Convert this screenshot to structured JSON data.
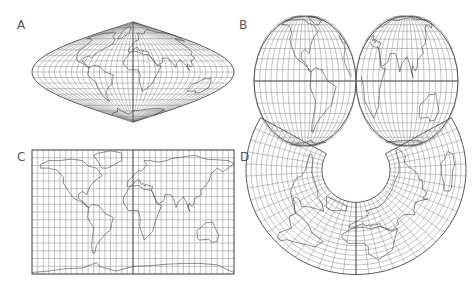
{
  "figure": {
    "panels": [
      {
        "id": "A",
        "label": "A",
        "projection": "sinusoidal"
      },
      {
        "id": "B",
        "label": "B",
        "projection": "interrupted-two-hemisphere"
      },
      {
        "id": "C",
        "label": "C",
        "projection": "rectangular (cylindrical)"
      },
      {
        "id": "D",
        "label": "D",
        "projection": "conic"
      }
    ]
  }
}
